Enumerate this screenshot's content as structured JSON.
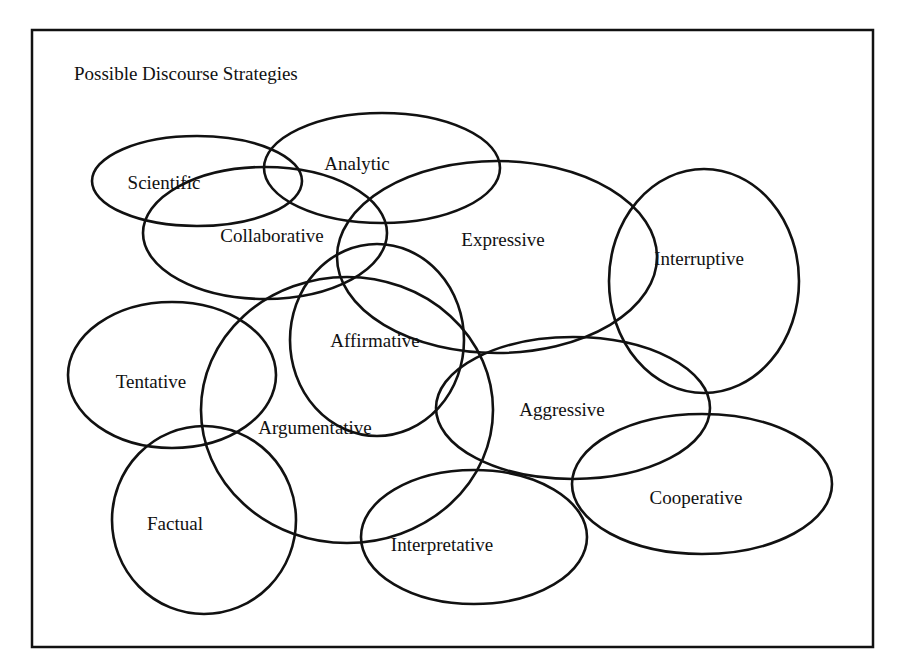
{
  "diagram": {
    "title": "Possible Discourse Strategies",
    "type": "overlapping-ellipses (Venn-like)",
    "line_color": "#111111",
    "background": "#ffffff",
    "strategies": [
      {
        "id": "scientific",
        "label": "Scientific",
        "cx": 197,
        "cy": 181,
        "rx": 105,
        "ry": 45,
        "lx": 164,
        "ly": 189
      },
      {
        "id": "analytic",
        "label": "Analytic",
        "cx": 382,
        "cy": 168,
        "rx": 118,
        "ry": 55,
        "lx": 357,
        "ly": 170
      },
      {
        "id": "collaborative",
        "label": "Collaborative",
        "cx": 265,
        "cy": 233,
        "rx": 122,
        "ry": 66,
        "lx": 272,
        "ly": 242
      },
      {
        "id": "expressive",
        "label": "Expressive",
        "cx": 497,
        "cy": 257,
        "rx": 160,
        "ry": 96,
        "lx": 503,
        "ly": 246
      },
      {
        "id": "interruptive",
        "label": "Interruptive",
        "cx": 704,
        "cy": 281,
        "rx": 95,
        "ry": 112,
        "lx": 699,
        "ly": 265
      },
      {
        "id": "affirmative",
        "label": "Affirmative",
        "cx": 377,
        "cy": 340,
        "rx": 87,
        "ry": 96,
        "lx": 375,
        "ly": 347
      },
      {
        "id": "argumentative",
        "label": "Argumentative",
        "cx": 347,
        "cy": 410,
        "rx": 146,
        "ry": 133,
        "lx": 315,
        "ly": 434
      },
      {
        "id": "tentative",
        "label": "Tentative",
        "cx": 172,
        "cy": 375,
        "rx": 104,
        "ry": 73,
        "lx": 151,
        "ly": 388
      },
      {
        "id": "aggressive",
        "label": "Aggressive",
        "cx": 573,
        "cy": 408,
        "rx": 137,
        "ry": 71,
        "lx": 562,
        "ly": 416
      },
      {
        "id": "factual",
        "label": "Factual",
        "cx": 204,
        "cy": 520,
        "rx": 92,
        "ry": 94,
        "lx": 175,
        "ly": 530
      },
      {
        "id": "interpretative",
        "label": "Interpretative",
        "cx": 474,
        "cy": 537,
        "rx": 113,
        "ry": 67,
        "lx": 442,
        "ly": 551
      },
      {
        "id": "cooperative",
        "label": "Cooperative",
        "cx": 702,
        "cy": 484,
        "rx": 130,
        "ry": 70,
        "lx": 696,
        "ly": 504
      }
    ]
  }
}
